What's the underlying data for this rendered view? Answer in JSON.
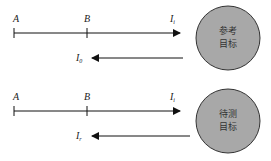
{
  "panels": [
    {
      "name": "reference",
      "point_a": "A",
      "point_b": "B",
      "incident_label": "I",
      "incident_sub": "i",
      "reflected_label": "I",
      "reflected_sub": "0",
      "target_line1": "参考",
      "target_line2": "目标"
    },
    {
      "name": "test",
      "point_a": "A",
      "point_b": "B",
      "incident_label": "I",
      "incident_sub": "i",
      "reflected_label": "I",
      "reflected_sub": "r",
      "target_line1": "待测",
      "target_line2": "目标"
    }
  ],
  "colors": {
    "target_fill": "#a8a8a8",
    "target_stroke": "#333333",
    "line": "#111111"
  }
}
